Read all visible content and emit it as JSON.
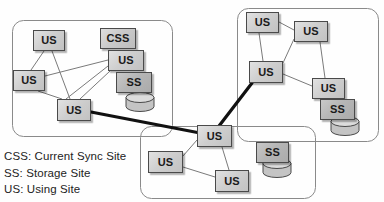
{
  "diagram": {
    "canvas": {
      "width": 384,
      "height": 202
    },
    "colors": {
      "background": "#fefefe",
      "node_fill_light": "#cfcfcf",
      "node_fill_dark": "#b6b6b6",
      "node_border": "#4a4a4a",
      "cluster_border": "#8a8a8a",
      "thin_link": "#7a7a7a",
      "thick_link": "#111111",
      "cylinder_fill": "#c4c4c4",
      "text": "#1a1a1a"
    },
    "clusters": [
      {
        "id": "cluster-left",
        "name": "left-site-group",
        "x": 12,
        "y": 20,
        "width": 160,
        "height": 116,
        "radius": 11
      },
      {
        "id": "cluster-right",
        "name": "right-site-group",
        "x": 237,
        "y": 8,
        "width": 141,
        "height": 133,
        "radius": 11
      },
      {
        "id": "cluster-bottom",
        "name": "bottom-site-group",
        "x": 140,
        "y": 126,
        "width": 175,
        "height": 72,
        "radius": 11
      }
    ],
    "nodes": [
      {
        "id": "L-us-top",
        "label": "US",
        "type": "us",
        "cluster": "cluster-left",
        "x": 33,
        "y": 30,
        "width": 32,
        "height": 21
      },
      {
        "id": "L-us-left",
        "label": "US",
        "type": "us",
        "cluster": "cluster-left",
        "x": 13,
        "y": 70,
        "width": 32,
        "height": 21
      },
      {
        "id": "L-us-bottom",
        "label": "US",
        "type": "us",
        "cluster": "cluster-left",
        "x": 57,
        "y": 99,
        "width": 34,
        "height": 22
      },
      {
        "id": "L-css",
        "label": "CSS",
        "type": "css",
        "cluster": "cluster-left",
        "x": 100,
        "y": 28,
        "width": 36,
        "height": 21
      },
      {
        "id": "L-us-stack",
        "label": "US",
        "type": "us",
        "cluster": "cluster-left",
        "x": 108,
        "y": 50,
        "width": 36,
        "height": 21
      },
      {
        "id": "L-ss",
        "label": "SS",
        "type": "ss",
        "cluster": "cluster-left",
        "x": 116,
        "y": 72,
        "width": 36,
        "height": 21
      },
      {
        "id": "R-us-top",
        "label": "US",
        "type": "us",
        "cluster": "cluster-right",
        "x": 246,
        "y": 12,
        "width": 33,
        "height": 21
      },
      {
        "id": "R-us-top2",
        "label": "US",
        "type": "us",
        "cluster": "cluster-right",
        "x": 294,
        "y": 21,
        "width": 34,
        "height": 21
      },
      {
        "id": "R-us-left",
        "label": "US",
        "type": "us",
        "cluster": "cluster-right",
        "x": 249,
        "y": 61,
        "width": 34,
        "height": 22
      },
      {
        "id": "R-us-right",
        "label": "US",
        "type": "us",
        "cluster": "cluster-right",
        "x": 312,
        "y": 78,
        "width": 33,
        "height": 21
      },
      {
        "id": "R-ss",
        "label": "SS",
        "type": "ss",
        "cluster": "cluster-right",
        "x": 320,
        "y": 99,
        "width": 35,
        "height": 21
      },
      {
        "id": "B-us-top",
        "label": "US",
        "type": "us",
        "cluster": "cluster-bottom",
        "x": 197,
        "y": 125,
        "width": 35,
        "height": 22
      },
      {
        "id": "B-us-left",
        "label": "US",
        "type": "us",
        "cluster": "cluster-bottom",
        "x": 148,
        "y": 151,
        "width": 35,
        "height": 22
      },
      {
        "id": "B-us-right",
        "label": "US",
        "type": "us",
        "cluster": "cluster-bottom",
        "x": 215,
        "y": 170,
        "width": 34,
        "height": 22
      },
      {
        "id": "B-ss",
        "label": "SS",
        "type": "ss",
        "cluster": "cluster-bottom",
        "x": 256,
        "y": 142,
        "width": 33,
        "height": 21
      }
    ],
    "cylinders": [
      {
        "id": "cyl-left",
        "name": "storage-cylinder-left",
        "cx": 140,
        "cy": 102,
        "rx": 14,
        "ry": 5,
        "body": 9
      },
      {
        "id": "cyl-right",
        "name": "storage-cylinder-right",
        "cx": 345,
        "cy": 126,
        "rx": 14,
        "ry": 5,
        "body": 9
      },
      {
        "id": "cyl-bottom",
        "name": "storage-cylinder-bottom",
        "cx": 277,
        "cy": 168,
        "rx": 14,
        "ry": 5,
        "body": 9
      }
    ],
    "links_thin": [
      {
        "from": "L-us-top",
        "to": "L-us-left",
        "x1": 44,
        "y1": 51,
        "x2": 31,
        "y2": 70
      },
      {
        "from": "L-us-top",
        "to": "L-us-bottom",
        "x1": 52,
        "y1": 51,
        "x2": 70,
        "y2": 99
      },
      {
        "from": "L-us-left",
        "to": "L-us-stack",
        "x1": 45,
        "y1": 76,
        "x2": 108,
        "y2": 60
      },
      {
        "from": "L-us-left",
        "to": "L-us-bottom",
        "x1": 38,
        "y1": 91,
        "x2": 62,
        "y2": 99
      },
      {
        "from": "L-us-bottom",
        "to": "L-us-stack",
        "x1": 80,
        "y1": 99,
        "x2": 110,
        "y2": 71
      },
      {
        "from": "L-us-stack",
        "to": "L-us-topX",
        "x1": 108,
        "y1": 66,
        "x2": 66,
        "y2": 99
      },
      {
        "from": "R-us-top",
        "to": "R-us-top2",
        "x1": 279,
        "y1": 22,
        "x2": 294,
        "y2": 30
      },
      {
        "from": "R-us-top",
        "to": "R-us-left",
        "x1": 259,
        "y1": 33,
        "x2": 263,
        "y2": 61
      },
      {
        "from": "R-us-top2",
        "to": "R-us-left",
        "x1": 294,
        "y1": 39,
        "x2": 283,
        "y2": 63
      },
      {
        "from": "R-us-top2",
        "to": "R-us-right",
        "x1": 320,
        "y1": 42,
        "x2": 325,
        "y2": 78
      },
      {
        "from": "R-us-left",
        "to": "R-us-right",
        "x1": 283,
        "y1": 74,
        "x2": 312,
        "y2": 86
      },
      {
        "from": "B-us-top",
        "to": "B-us-left",
        "x1": 197,
        "y1": 140,
        "x2": 183,
        "y2": 156
      },
      {
        "from": "B-us-top",
        "to": "B-us-right",
        "x1": 222,
        "y1": 147,
        "x2": 229,
        "y2": 170
      },
      {
        "from": "B-us-left",
        "to": "B-us-right",
        "x1": 183,
        "y1": 167,
        "x2": 215,
        "y2": 177
      }
    ],
    "links_thick": [
      {
        "from": "L-us-bottom",
        "to": "B-us-top",
        "x1": 91,
        "y1": 112,
        "x2": 200,
        "y2": 133
      },
      {
        "from": "R-us-left",
        "to": "B-us-top",
        "x1": 252,
        "y1": 83,
        "x2": 219,
        "y2": 126
      }
    ],
    "legend": {
      "name": "abbreviation-legend",
      "items": [
        {
          "abbr": "CSS",
          "text": "CSS: Current Sync Site"
        },
        {
          "abbr": "SS",
          "text": "SS: Storage Site"
        },
        {
          "abbr": "US",
          "text": "US: Using Site"
        }
      ]
    }
  }
}
